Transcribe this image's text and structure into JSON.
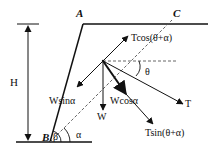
{
  "diagram": {
    "type": "force-diagram",
    "points": {
      "A": "A",
      "B": "B",
      "C": "C"
    },
    "dimension": {
      "label": "H"
    },
    "angles": {
      "beta": "β",
      "alpha": "α",
      "theta": "θ"
    },
    "forces": {
      "tcos": "Tcos(θ+α)",
      "wsin": "Wsinα",
      "wcos": "Wcosα",
      "w": "W",
      "t": "T",
      "tsin": "Tsin(θ+α)"
    },
    "colors": {
      "line": "#111111",
      "dashed": "#555555",
      "background": "#ffffff"
    }
  }
}
